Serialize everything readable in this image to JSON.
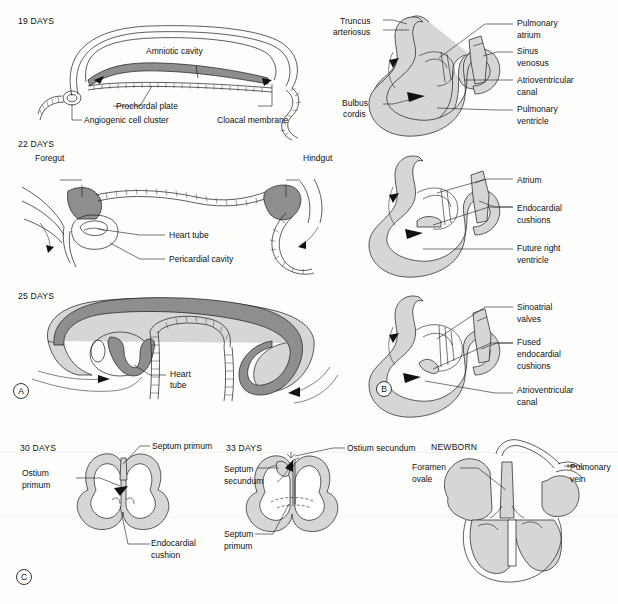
{
  "figure": {
    "colors": {
      "dark_tissue": "#8e8e8e",
      "mid_tissue": "#b9b9b9",
      "light_tissue": "#d6d6d6",
      "outline": "#1a1a1a",
      "background": "#fdfdfb"
    }
  },
  "panels": [
    {
      "mark": "A",
      "name": "panel-a-folding",
      "stages": [
        {
          "title": "19 DAYS",
          "labels": [
            {
              "text": "Amniotic cavity"
            },
            {
              "text": "Prochordal plate"
            },
            {
              "text": "Angiogenic cell cluster"
            },
            {
              "text": "Cloacal membrane"
            }
          ]
        },
        {
          "title": "22 DAYS",
          "labels": [
            {
              "text": "Foregut"
            },
            {
              "text": "Hindgut"
            },
            {
              "text": "Heart tube"
            },
            {
              "text": "Pericardial cavity"
            }
          ]
        },
        {
          "title": "25 DAYS",
          "labels": [
            {
              "text": "Heart"
            },
            {
              "text": "tube"
            }
          ]
        }
      ]
    },
    {
      "mark": "B",
      "name": "panel-b-heart-loop",
      "stages": [
        {
          "title": "",
          "labels": [
            {
              "text": "Truncus"
            },
            {
              "text": "arteriosus"
            },
            {
              "text": "Bulbus"
            },
            {
              "text": "cordis"
            },
            {
              "text": "Pulmonary"
            },
            {
              "text": "atrium"
            },
            {
              "text": "Sinus"
            },
            {
              "text": "venosus"
            },
            {
              "text": "Atrioventricular"
            },
            {
              "text": "canal"
            },
            {
              "text": "Pulmonary"
            },
            {
              "text": "ventricle"
            }
          ]
        },
        {
          "title": "",
          "labels": [
            {
              "text": "Atrium"
            },
            {
              "text": "Endocardial"
            },
            {
              "text": "cushions"
            },
            {
              "text": "Future right"
            },
            {
              "text": "ventricle"
            }
          ]
        },
        {
          "title": "",
          "labels": [
            {
              "text": "Sinoatrial"
            },
            {
              "text": "valves"
            },
            {
              "text": "Fused"
            },
            {
              "text": "endocardial"
            },
            {
              "text": "cushions"
            },
            {
              "text": "Atrioventricular"
            },
            {
              "text": "canal"
            }
          ]
        }
      ]
    },
    {
      "mark": "C",
      "name": "panel-c-septation",
      "stages": [
        {
          "title": "30 DAYS",
          "labels": [
            {
              "text": "Septum primum"
            },
            {
              "text": "Ostium"
            },
            {
              "text": "primum"
            },
            {
              "text": "Endocardial"
            },
            {
              "text": "cushion"
            }
          ]
        },
        {
          "title": "33 DAYS",
          "labels": [
            {
              "text": "Ostium secundum"
            },
            {
              "text": "Septum"
            },
            {
              "text": "secundum"
            },
            {
              "text": "Septum"
            },
            {
              "text": "primum"
            }
          ]
        },
        {
          "title": "NEWBORN",
          "labels": [
            {
              "text": "Foramen"
            },
            {
              "text": "ovale"
            },
            {
              "text": "Pulmonary"
            },
            {
              "text": "vein"
            }
          ]
        }
      ]
    }
  ],
  "text": {
    "d19": "19 DAYS",
    "d22": "22 DAYS",
    "d25": "25 DAYS",
    "d30": "30 DAYS",
    "d33": "33 DAYS",
    "newborn": "NEWBORN",
    "amniotic_cavity": "Amniotic cavity",
    "prochordal_plate": "Prochordal plate",
    "angiogenic_cell_cluster": "Angiogenic cell cluster",
    "cloacal_membrane": "Cloacal membrane",
    "foregut": "Foregut",
    "hindgut": "Hindgut",
    "heart_tube": "Heart tube",
    "pericardial_cavity": "Pericardial cavity",
    "heart_l1": "Heart",
    "heart_l2": "tube",
    "truncus_1": "Truncus",
    "truncus_2": "arteriosus",
    "bulbus_1": "Bulbus",
    "bulbus_2": "cordis",
    "pulm_atrium_1": "Pulmonary",
    "pulm_atrium_2": "atrium",
    "sinus_1": "Sinus",
    "sinus_2": "venosus",
    "av_canal_1": "Atrioventricular",
    "av_canal_2": "canal",
    "pulm_vent_1": "Pulmonary",
    "pulm_vent_2": "ventricle",
    "atrium": "Atrium",
    "endo_cush_1": "Endocardial",
    "endo_cush_2": "cushions",
    "future_rv_1": "Future right",
    "future_rv_2": "ventricle",
    "sino_valves_1": "Sinoatrial",
    "sino_valves_2": "valves",
    "fused_1": "Fused",
    "fused_2": "endocardial",
    "fused_3": "cushions",
    "av_canal2_1": "Atrioventricular",
    "av_canal2_2": "canal",
    "septum_primum": "Septum primum",
    "ostium_primum_1": "Ostium",
    "ostium_primum_2": "primum",
    "endo_cushion_1": "Endocardial",
    "endo_cushion_2": "cushion",
    "ostium_secundum": "Ostium secundum",
    "septum_sec_1": "Septum",
    "septum_sec_2": "secundum",
    "septum_pri_1": "Septum",
    "septum_pri_2": "primum",
    "foramen_1": "Foramen",
    "foramen_2": "ovale",
    "pulm_vein_1": "Pulmonary",
    "pulm_vein_2": "vein",
    "mark_a": "A",
    "mark_b": "B",
    "mark_c": "C"
  }
}
